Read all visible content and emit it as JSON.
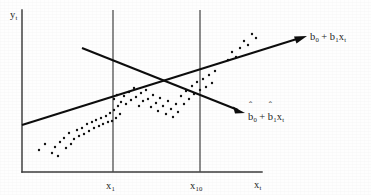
{
  "figure": {
    "background_color": "#fefefe",
    "ink_color": "#131313",
    "axis_color": "#3a3a3a"
  },
  "labels": {
    "y_axis": {
      "base": "y",
      "sub": "t"
    },
    "x_axis": {
      "base": "x",
      "sub": "t"
    },
    "tick_x1": {
      "base": "x",
      "sub": "1"
    },
    "tick_x10": {
      "base": "x",
      "sub": "10"
    },
    "true_line": {
      "term1_base": "b",
      "term1_sub": "0",
      "operator": "+",
      "term2_base": "b",
      "term2_sub": "1",
      "term3_base": "x",
      "term3_sub": "t",
      "hat1": "",
      "hat2": ""
    },
    "fitted_line": {
      "term1_base": "b",
      "term1_sub": "0",
      "operator": "+",
      "term2_base": "b",
      "term2_sub": "1",
      "term3_base": "x",
      "term3_sub": "t",
      "hat1": "ˆ",
      "hat2": "ˆ"
    }
  },
  "chart_data": {
    "type": "scatter",
    "title": "",
    "xlabel": "x_t",
    "ylabel": "y_t",
    "grid": false,
    "legend_position": "inline-annotation",
    "axes": {
      "origin_px": [
        22,
        172
      ],
      "x_axis_end_px": [
        262,
        172
      ],
      "y_axis_top_px": [
        22,
        10
      ]
    },
    "vertical_reference_lines": [
      {
        "label": "x_1",
        "x_px": 113,
        "y_top_px": 10,
        "y_bottom_px": 172
      },
      {
        "label": "x_10",
        "x_px": 200,
        "y_top_px": 10,
        "y_bottom_px": 172
      }
    ],
    "series": [
      {
        "name": "b_0 + b_1 x_t",
        "type": "line",
        "annotation": "b0 + b1xt",
        "arrow": true,
        "start_px": [
          22,
          125
        ],
        "end_px": [
          307,
          36
        ],
        "slope_sign": "positive"
      },
      {
        "name": "bhat_0 + bhat_1 x_t",
        "type": "line",
        "annotation": "bhat0 + bhat1xt",
        "arrow": true,
        "start_px": [
          82,
          48
        ],
        "end_px": [
          245,
          113
        ],
        "slope_sign": "negative"
      },
      {
        "name": "observations",
        "type": "scatter",
        "marker": "dot",
        "marker_size_px": 1.5,
        "count": 78,
        "points_px": [
          [
            39,
            150
          ],
          [
            45,
            144
          ],
          [
            52,
            153
          ],
          [
            55,
            147
          ],
          [
            58,
            156
          ],
          [
            60,
            142
          ],
          [
            64,
            138
          ],
          [
            66,
            148
          ],
          [
            69,
            133
          ],
          [
            71,
            144
          ],
          [
            74,
            139
          ],
          [
            77,
            130
          ],
          [
            79,
            136
          ],
          [
            82,
            128
          ],
          [
            84,
            134
          ],
          [
            87,
            124
          ],
          [
            89,
            131
          ],
          [
            92,
            122
          ],
          [
            94,
            128
          ],
          [
            96,
            120
          ],
          [
            99,
            126
          ],
          [
            101,
            118
          ],
          [
            103,
            124
          ],
          [
            106,
            116
          ],
          [
            108,
            122
          ],
          [
            110,
            113
          ],
          [
            112,
            121
          ],
          [
            114,
            110
          ],
          [
            116,
            118
          ],
          [
            118,
            106
          ],
          [
            120,
            114
          ],
          [
            114,
            99
          ],
          [
            117,
            95
          ],
          [
            121,
            102
          ],
          [
            124,
            96
          ],
          [
            126,
            104
          ],
          [
            129,
            92
          ],
          [
            131,
            100
          ],
          [
            134,
            88
          ],
          [
            136,
            97
          ],
          [
            139,
            106
          ],
          [
            141,
            93
          ],
          [
            143,
            101
          ],
          [
            146,
            90
          ],
          [
            148,
            99
          ],
          [
            151,
            107
          ],
          [
            153,
            95
          ],
          [
            156,
            103
          ],
          [
            158,
            111
          ],
          [
            160,
            98
          ],
          [
            163,
            106
          ],
          [
            166,
            114
          ],
          [
            168,
            101
          ],
          [
            171,
            109
          ],
          [
            173,
            117
          ],
          [
            176,
            104
          ],
          [
            178,
            112
          ],
          [
            181,
            96
          ],
          [
            184,
            104
          ],
          [
            186,
            91
          ],
          [
            189,
            99
          ],
          [
            192,
            86
          ],
          [
            194,
            94
          ],
          [
            197,
            82
          ],
          [
            200,
            90
          ],
          [
            203,
            79
          ],
          [
            206,
            87
          ],
          [
            209,
            75
          ],
          [
            212,
            83
          ],
          [
            215,
            71
          ],
          [
            228,
            60
          ],
          [
            232,
            52
          ],
          [
            236,
            57
          ],
          [
            240,
            48
          ],
          [
            244,
            41
          ],
          [
            248,
            45
          ],
          [
            252,
            34
          ],
          [
            256,
            38
          ]
        ]
      }
    ]
  }
}
